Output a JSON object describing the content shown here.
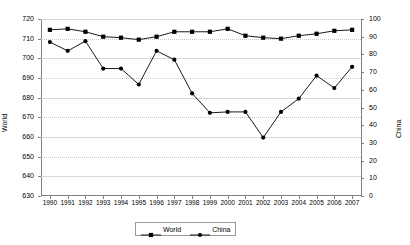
{
  "chart_data": {
    "type": "line",
    "title": "",
    "xlabel": "",
    "ylabel": "World",
    "y2label": "China",
    "grid": true,
    "legend_position": "bottom",
    "x": [
      1990,
      1991,
      1992,
      1993,
      1994,
      1995,
      1996,
      1997,
      1998,
      1999,
      2000,
      2001,
      2002,
      2003,
      2004,
      2005,
      2006,
      2007
    ],
    "categories": [
      "1990",
      "1991",
      "1992",
      "1993",
      "1994",
      "1995",
      "1996",
      "1997",
      "1998",
      "1999",
      "2000",
      "2001",
      "2002",
      "2003",
      "2004",
      "2005",
      "2006",
      "2007"
    ],
    "ylim": [
      630,
      720
    ],
    "yticks": [
      630,
      640,
      650,
      660,
      670,
      680,
      690,
      700,
      710,
      720
    ],
    "y2lim": [
      0,
      100
    ],
    "y2ticks": [
      0,
      10,
      20,
      30,
      40,
      50,
      60,
      70,
      80,
      90,
      100
    ],
    "series": [
      {
        "name": "World",
        "axis": "left",
        "marker": "square",
        "color": "#000000",
        "values": [
          714.5,
          715.0,
          713.5,
          711.0,
          710.5,
          709.5,
          711.0,
          713.5,
          713.5,
          713.5,
          715.0,
          711.5,
          710.5,
          710.0,
          711.5,
          712.5,
          714.0,
          714.5
        ]
      },
      {
        "name": "China",
        "axis": "right",
        "marker": "circle",
        "color": "#000000",
        "values": [
          87.0,
          82.0,
          87.5,
          72.0,
          72.0,
          63.0,
          82.0,
          77.0,
          58.0,
          47.0,
          47.5,
          47.5,
          33.0,
          47.5,
          55.0,
          68.0,
          61.0,
          73.0
        ]
      }
    ]
  },
  "axes": {
    "left_title": "World",
    "right_title": "China"
  },
  "legend": {
    "items": [
      {
        "label": "World",
        "marker": "square"
      },
      {
        "label": "China",
        "marker": "circle"
      }
    ]
  }
}
